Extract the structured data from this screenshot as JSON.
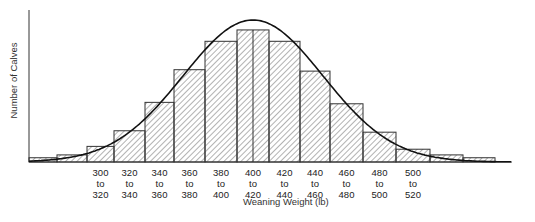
{
  "chart_data": {
    "type": "bar",
    "subtype": "histogram with fitted normal curve",
    "title": "",
    "xlabel": "Weaning Weight (lb)",
    "ylabel": "Number of Calves",
    "categories": [
      "<280",
      "280 to 300",
      "300 to 320",
      "320 to 340",
      "340 to 360",
      "360 to 380",
      "380 to 400",
      "400 to 420",
      "420 to 440",
      "440 to 460",
      "460 to 480",
      "480 to 500",
      "500 to 520",
      "520 to 540",
      "540 to 560",
      "560 to 580"
    ],
    "tick_labels": [
      {
        "top": "300",
        "mid": "to",
        "bottom": "320"
      },
      {
        "top": "320",
        "mid": "to",
        "bottom": "340"
      },
      {
        "top": "340",
        "mid": "to",
        "bottom": "360"
      },
      {
        "top": "360",
        "mid": "to",
        "bottom": "380"
      },
      {
        "top": "380",
        "mid": "to",
        "bottom": "400"
      },
      {
        "top": "400",
        "mid": "to",
        "bottom": "420"
      },
      {
        "top": "420",
        "mid": "to",
        "bottom": "440"
      },
      {
        "top": "440",
        "mid": "to",
        "bottom": "460"
      },
      {
        "top": "460",
        "mid": "to",
        "bottom": "480"
      },
      {
        "top": "480",
        "mid": "to",
        "bottom": "500"
      },
      {
        "top": "500",
        "mid": "to",
        "bottom": "520"
      }
    ],
    "values_relative": [
      3,
      5,
      11,
      22,
      42,
      65,
      85,
      93,
      85,
      64,
      41,
      21,
      9,
      5,
      3
    ],
    "note": "Y-axis has no numeric ticks; values are relative bar heights (percent of peak, estimated). The 400-420 bar is drawn split into two halves.",
    "curve": "normal distribution overlay, mean ≈ 410 lb",
    "grid": false,
    "legend": null,
    "colors": {
      "bar_fill": "hatched diagonal",
      "stroke": "#222222",
      "background": "#ffffff"
    }
  }
}
